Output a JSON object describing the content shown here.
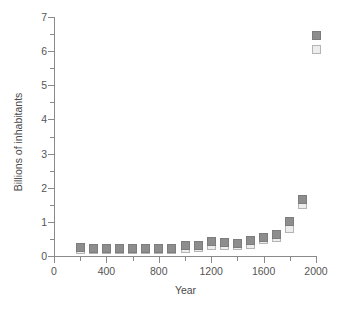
{
  "chart_data": {
    "type": "scatter",
    "title": "",
    "xlabel": "Year",
    "ylabel": "Billions of inhabitants",
    "xlim": [
      0,
      2000
    ],
    "ylim": [
      0,
      7
    ],
    "grid": false,
    "legend_position": "none",
    "x_ticks": [
      0,
      400,
      800,
      1200,
      1600,
      2000
    ],
    "x_minor_ticks": [
      200,
      600,
      1000,
      1400,
      1800
    ],
    "y_ticks": [
      0,
      1,
      2,
      3,
      4,
      5,
      6,
      7
    ],
    "y_minor_ticks": [
      0.5,
      1.5,
      2.5,
      3.5,
      4.5,
      5.5,
      6.5
    ],
    "x": [
      200,
      300,
      400,
      500,
      600,
      700,
      800,
      900,
      1000,
      1100,
      1200,
      1300,
      1400,
      1500,
      1600,
      1700,
      1800,
      1900,
      2000
    ],
    "series": [
      {
        "name": "High estimate",
        "marker": "filled-square",
        "color": "#8d8d8d",
        "values": [
          0.26,
          0.22,
          0.22,
          0.21,
          0.21,
          0.21,
          0.22,
          0.23,
          0.3,
          0.31,
          0.42,
          0.4,
          0.37,
          0.46,
          0.55,
          0.64,
          1.0,
          1.65,
          6.45
        ]
      },
      {
        "name": "Low estimate",
        "marker": "open-square",
        "color": "#ededed",
        "values": [
          0.19,
          0.19,
          0.19,
          0.19,
          0.19,
          0.19,
          0.19,
          0.2,
          0.22,
          0.26,
          0.31,
          0.32,
          0.31,
          0.35,
          0.48,
          0.55,
          0.8,
          1.5,
          6.05
        ]
      }
    ]
  },
  "axes": {
    "y_tick_labels": [
      "0",
      "1",
      "2",
      "3",
      "4",
      "5",
      "6",
      "7"
    ],
    "x_tick_labels": [
      "0",
      "400",
      "800",
      "1200",
      "1600",
      "2000"
    ],
    "y_axis_title": "Billions of inhabitants",
    "x_axis_title": "Year"
  },
  "colors": {
    "high_marker": "#8d8d8d",
    "low_marker": "#ededed",
    "axis": "#8a8a8a",
    "text": "#555555",
    "background": "#ffffff"
  }
}
